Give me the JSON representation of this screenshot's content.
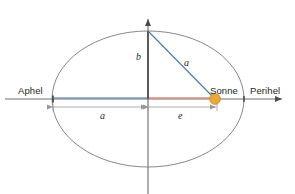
{
  "figure": {
    "background": "#ffffff",
    "width": 295,
    "height": 194
  },
  "colors": {
    "axis": "#6e6e72",
    "ellipse": "#7a7a7e",
    "semi_major_line": "#4a77a8",
    "focus_line": "#d98b80",
    "radius_line": "#4a77a8",
    "semi_minor_line": "#4f4a45",
    "sun_fill": "#e8a93a",
    "sun_stroke": "#c98a24",
    "dimension": "#9a9a9e",
    "text": "#231f20"
  },
  "labels": {
    "aphel": "Aphel",
    "perihel": "Perihel",
    "sonne": "Sonne",
    "semi_minor": "b",
    "radius": "a",
    "semi_major_dimension": "a",
    "eccentricity_dimension": "e"
  },
  "geometry": {
    "ellipse": {
      "cx": 148,
      "cy": 99,
      "rx": 96,
      "ry": 68
    },
    "sun": {
      "cx": 215,
      "cy": 99,
      "r": 5.5
    },
    "apex": {
      "x": 148,
      "y": 31
    },
    "left_vertex": {
      "x": 53,
      "y": 99
    },
    "right_vertex": {
      "x": 244,
      "y": 99
    },
    "horizontal_axis": {
      "x1": 5,
      "x2": 288,
      "y": 99
    },
    "vertical_axis": {
      "x": 148,
      "y1": 13,
      "y2": 194
    },
    "dimension_a": {
      "x1": 53,
      "x2": 148,
      "y": 107
    },
    "dimension_e": {
      "x1": 148,
      "x2": 217,
      "y": 107
    }
  }
}
